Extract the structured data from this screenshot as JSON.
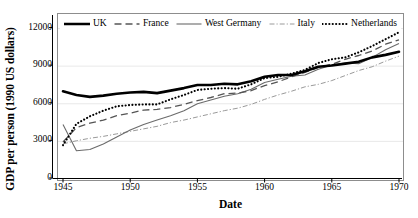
{
  "chart_data": {
    "type": "line",
    "title": "",
    "xlabel": "Date",
    "ylabel": "GDP per person (1990 US dollars)",
    "xlim": [
      1945,
      1970
    ],
    "ylim": [
      0,
      13000
    ],
    "xticks": [
      "1945",
      "1950",
      "1955",
      "1960",
      "1965",
      "1970"
    ],
    "yticks": [
      "0",
      "3000",
      "6000",
      "9000",
      "12000"
    ],
    "grid": false,
    "legend_position": "top-inside",
    "x": [
      1945,
      1946,
      1947,
      1948,
      1949,
      1950,
      1951,
      1952,
      1953,
      1954,
      1955,
      1956,
      1957,
      1958,
      1959,
      1960,
      1961,
      1962,
      1963,
      1964,
      1965,
      1966,
      1967,
      1968,
      1969,
      1970
    ],
    "series": [
      {
        "name": "UK",
        "style": "solid-thick-black",
        "color": "#000000",
        "values": [
          7000,
          6700,
          6550,
          6650,
          6800,
          6900,
          6950,
          6850,
          7050,
          7250,
          7500,
          7500,
          7600,
          7550,
          7800,
          8150,
          8300,
          8300,
          8600,
          8950,
          9050,
          9200,
          9350,
          9700,
          9900,
          10150
        ]
      },
      {
        "name": "France",
        "style": "dashed-gray",
        "color": "#555555",
        "values": [
          2950,
          4100,
          4450,
          4700,
          5050,
          5250,
          5500,
          5550,
          5700,
          5950,
          6250,
          6500,
          6800,
          6850,
          7050,
          7450,
          7750,
          8150,
          8500,
          8900,
          9150,
          9550,
          9850,
          10200,
          10750,
          11100
        ]
      },
      {
        "name": "West Germany",
        "style": "solid-thin-gray",
        "color": "#6b6b6b",
        "values": [
          4350,
          2250,
          2350,
          2800,
          3350,
          3900,
          4350,
          4700,
          5050,
          5450,
          6000,
          6300,
          6600,
          6800,
          7150,
          7700,
          7950,
          8200,
          8300,
          8750,
          9100,
          9250,
          9200,
          9700,
          10300,
          10800
        ]
      },
      {
        "name": "Italy",
        "style": "dashdot-lightgray",
        "color": "#9a9a9a",
        "values": [
          2800,
          3050,
          3250,
          3400,
          3600,
          3800,
          4000,
          4200,
          4500,
          4700,
          4950,
          5200,
          5450,
          5650,
          5950,
          6350,
          6700,
          7000,
          7350,
          7550,
          7850,
          8250,
          8650,
          8950,
          9400,
          9800
        ]
      },
      {
        "name": "Netherlands",
        "style": "dotted-black",
        "color": "#000000",
        "values": [
          2700,
          4400,
          5000,
          5450,
          5800,
          5900,
          5950,
          5950,
          6350,
          6700,
          7100,
          7200,
          7250,
          7200,
          7550,
          8050,
          8150,
          8400,
          8700,
          9250,
          9550,
          9700,
          10100,
          10600,
          11150,
          11700
        ]
      }
    ]
  },
  "legend": {
    "items": [
      {
        "label": "UK"
      },
      {
        "label": "France"
      },
      {
        "label": "West Germany"
      },
      {
        "label": "Italy"
      },
      {
        "label": "Netherlands"
      }
    ]
  }
}
